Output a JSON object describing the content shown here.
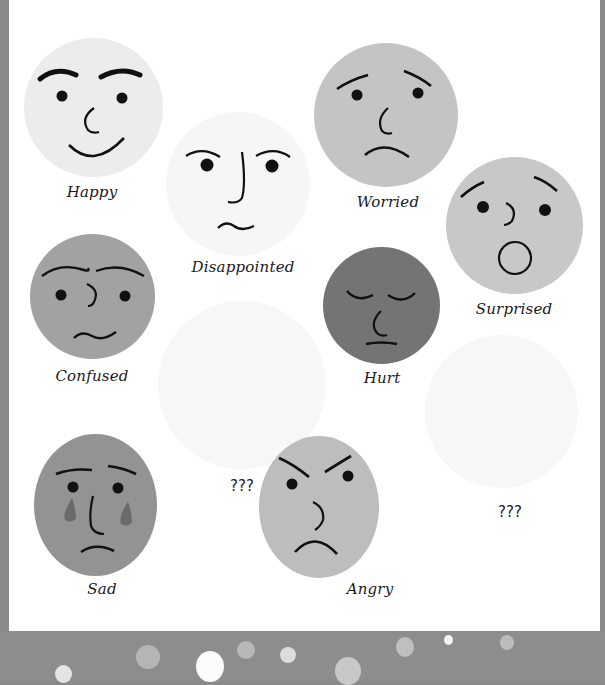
{
  "worksheet": {
    "faces": [
      {
        "id": "happy",
        "label": "Happy",
        "color": "#ececec"
      },
      {
        "id": "disappointed",
        "label": "Disappointed",
        "color": "#f6f6f6"
      },
      {
        "id": "worried",
        "label": "Worried",
        "color": "#c4c4c4"
      },
      {
        "id": "surprised",
        "label": "Surprised",
        "color": "#c8c8c8"
      },
      {
        "id": "confused",
        "label": "Confused",
        "color": "#a2a2a2"
      },
      {
        "id": "hurt",
        "label": "Hurt",
        "color": "#747474"
      },
      {
        "id": "sad",
        "label": "Sad",
        "color": "#939393"
      },
      {
        "id": "angry",
        "label": "Angry",
        "color": "#bdbdbd"
      }
    ],
    "unknown_faces": [
      {
        "label": "???",
        "color": "#f7f7f7"
      },
      {
        "label": "???",
        "color": "#f7f7f7"
      }
    ],
    "tear_color": "#6a6a6a"
  },
  "colors": {
    "border": "#8a8a8a",
    "panel": "#ffffff",
    "feature": "#111111"
  }
}
